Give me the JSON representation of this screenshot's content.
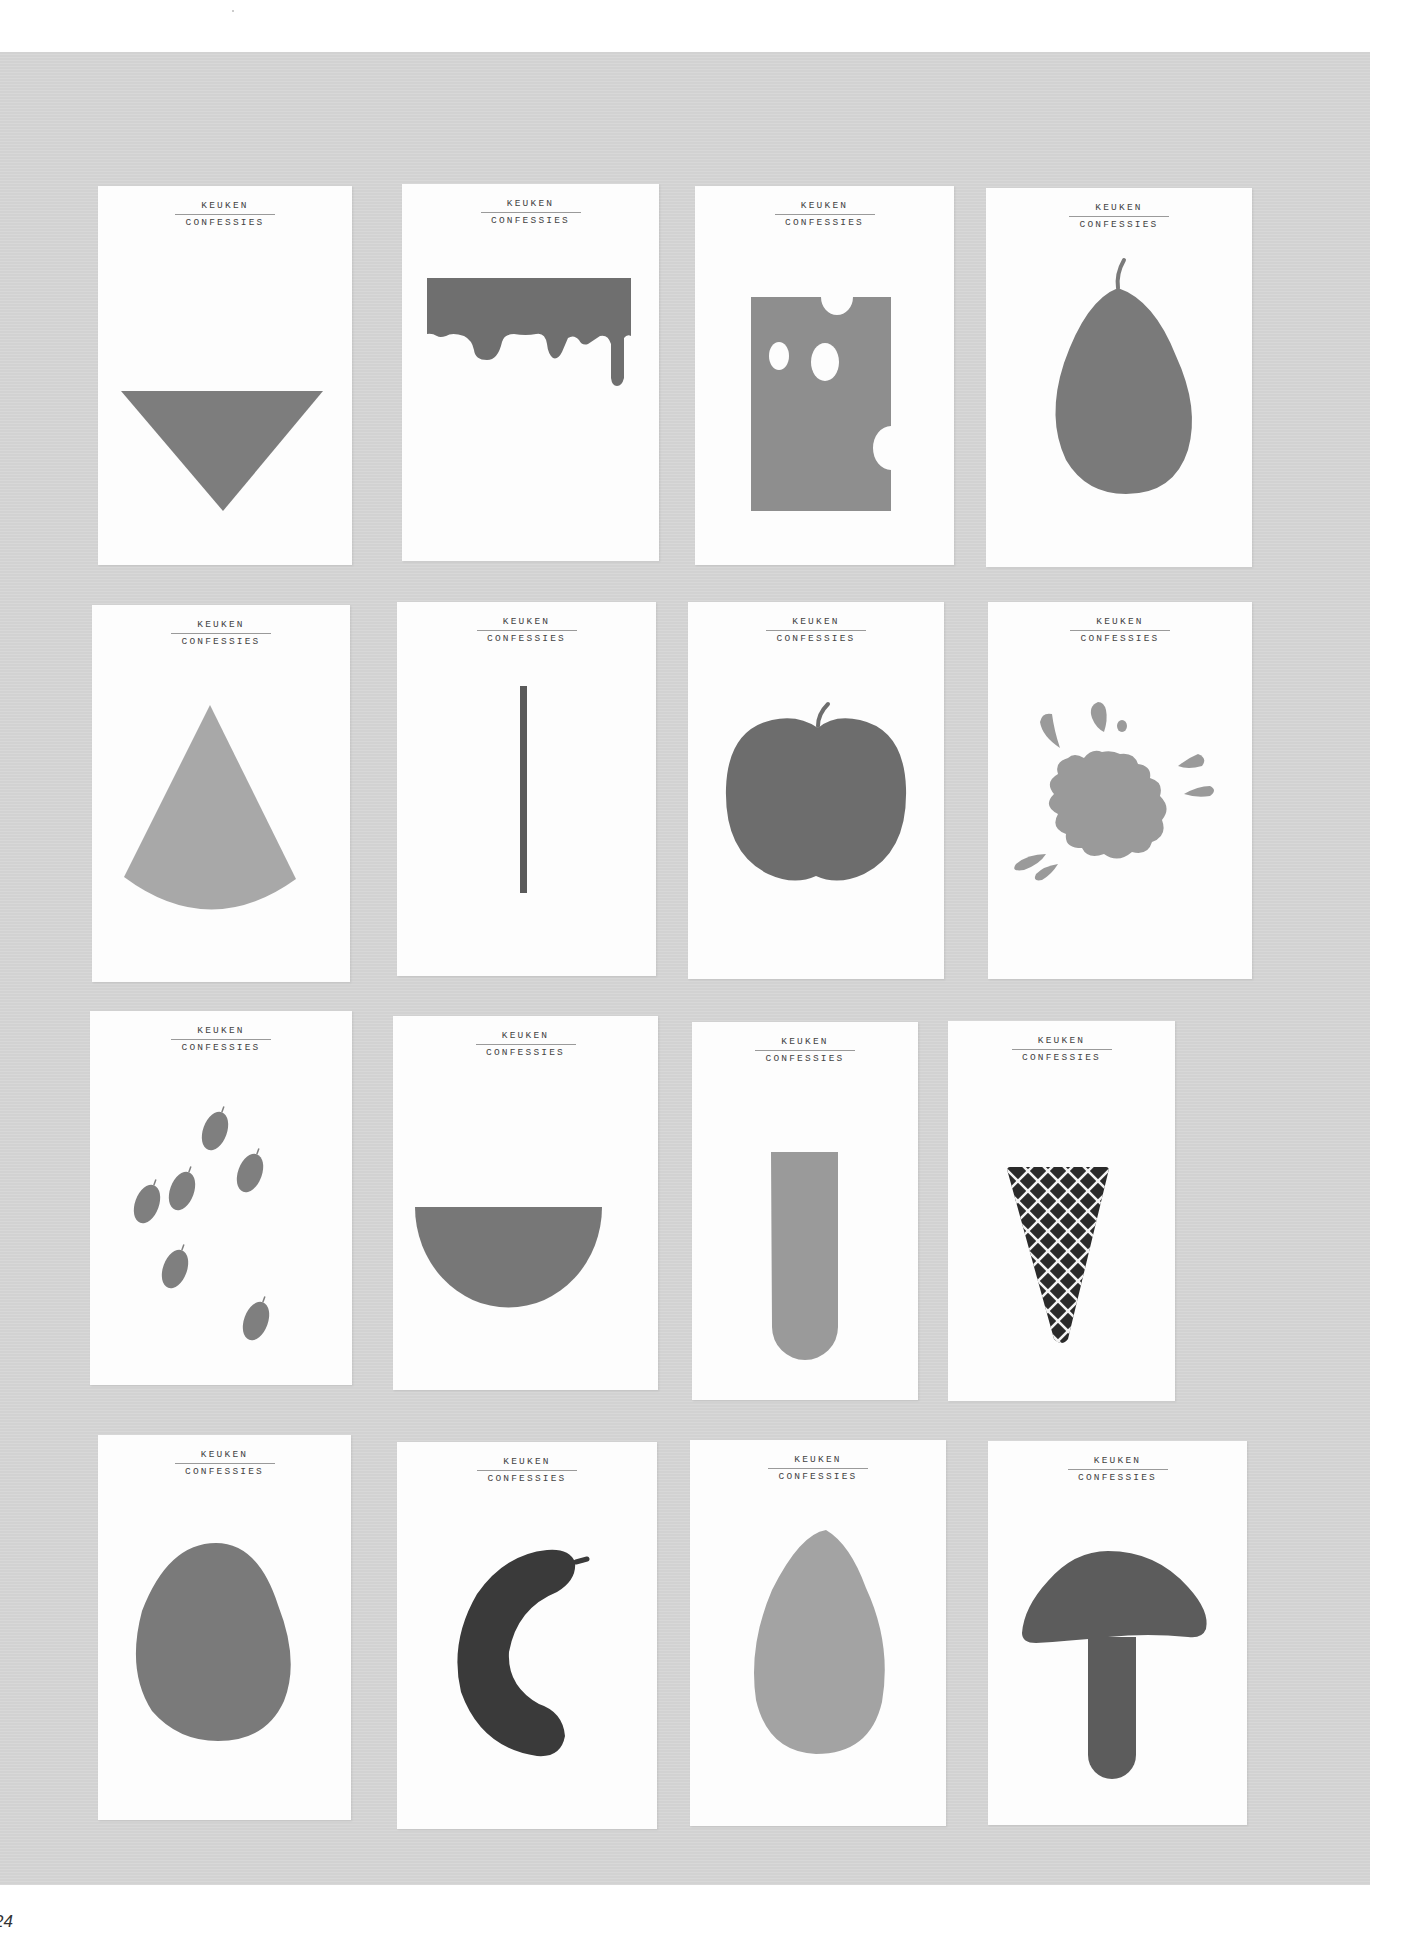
{
  "page": {
    "page_number": "24",
    "background_color": "#d6d6d6"
  },
  "card_header": {
    "line1": "KEUKEN",
    "line2": "CONFESSIES"
  },
  "cards": [
    {
      "name": "inverted-triangle",
      "shape_color": "#7d7d7d"
    },
    {
      "name": "dripping-bar",
      "shape_color": "#6f6f6f"
    },
    {
      "name": "cheese-block",
      "shape_color": "#8e8e8e"
    },
    {
      "name": "pear",
      "shape_color": "#7a7a7a"
    },
    {
      "name": "pie-slice",
      "shape_color": "#a8a8a8"
    },
    {
      "name": "thin-stick",
      "shape_color": "#5a5a5a"
    },
    {
      "name": "apple",
      "shape_color": "#6d6d6d"
    },
    {
      "name": "splash",
      "shape_color": "#9a9a9a"
    },
    {
      "name": "seeds",
      "shape_color": "#7f7f7f"
    },
    {
      "name": "bowl",
      "shape_color": "#777777"
    },
    {
      "name": "test-tube",
      "shape_color": "#9a9a9a"
    },
    {
      "name": "waffle-cone",
      "shape_color": "#2a2a2a"
    },
    {
      "name": "egg",
      "shape_color": "#7a7a7a"
    },
    {
      "name": "sausage",
      "shape_color": "#3a3a3a"
    },
    {
      "name": "almond",
      "shape_color": "#a3a3a3"
    },
    {
      "name": "mushroom",
      "shape_color": "#5c5c5c"
    }
  ]
}
